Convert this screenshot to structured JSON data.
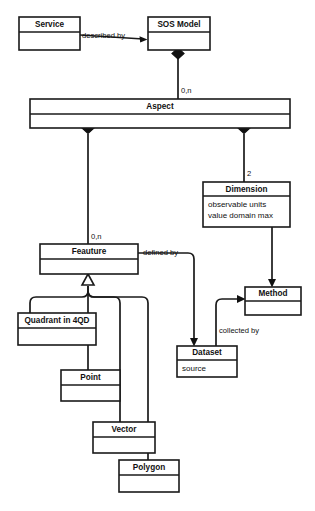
{
  "diagram": {
    "type": "uml-class-diagram",
    "background_color": "#ffffff",
    "line_color": "#1a1a1a",
    "text_color": "#111111",
    "classes": [
      {
        "id": "service",
        "name": "Service",
        "attributes": [],
        "x": 19,
        "y": 17,
        "w": 61,
        "h": 33,
        "title_h": 15
      },
      {
        "id": "sos_model",
        "name": "SOS Model",
        "attributes": [],
        "x": 148,
        "y": 17,
        "w": 62,
        "h": 33,
        "title_h": 15
      },
      {
        "id": "aspect",
        "name": "Aspect",
        "attributes": [],
        "x": 30,
        "y": 99,
        "w": 260,
        "h": 29,
        "title_h": 15
      },
      {
        "id": "dimension",
        "name": "Dimension",
        "attributes": [
          "observable units",
          "value domain max"
        ],
        "x": 203,
        "y": 182,
        "w": 87,
        "h": 45,
        "title_h": 14
      },
      {
        "id": "feauture",
        "name": "Feauture",
        "attributes": [],
        "x": 40,
        "y": 244,
        "w": 98,
        "h": 30,
        "title_h": 15
      },
      {
        "id": "method",
        "name": "Method",
        "attributes": [],
        "x": 245,
        "y": 287,
        "w": 56,
        "h": 28,
        "title_h": 14
      },
      {
        "id": "dataset",
        "name": "Dataset",
        "attributes": [
          "source"
        ],
        "x": 177,
        "y": 346,
        "w": 60,
        "h": 31,
        "title_h": 14
      },
      {
        "id": "quadrant_in_4qd",
        "name": "Quadrant in 4QD",
        "attributes": [],
        "x": 18,
        "y": 313,
        "w": 78,
        "h": 32,
        "title_h": 15
      },
      {
        "id": "point",
        "name": "Point",
        "attributes": [],
        "x": 61,
        "y": 370,
        "w": 59,
        "h": 31,
        "title_h": 15
      },
      {
        "id": "vector",
        "name": "Vector",
        "attributes": [],
        "x": 93,
        "y": 422,
        "w": 62,
        "h": 31,
        "title_h": 15
      },
      {
        "id": "polygon",
        "name": "Polygon",
        "attributes": [],
        "x": 119,
        "y": 460,
        "w": 60,
        "h": 32,
        "title_h": 15
      }
    ],
    "relationships": [
      {
        "id": "service-described-by-sos",
        "from": "service",
        "to": "sos_model",
        "label": "described by",
        "kind": "association-directed"
      },
      {
        "id": "sos-composes-aspect",
        "from": "sos_model",
        "to": "aspect",
        "label": "",
        "multiplicity": "0,n",
        "kind": "composition"
      },
      {
        "id": "aspect-composes-dimension",
        "from": "aspect",
        "to": "dimension",
        "label": "",
        "multiplicity": "2",
        "kind": "composition"
      },
      {
        "id": "aspect-composes-feauture",
        "from": "aspect",
        "to": "feauture",
        "label": "",
        "multiplicity": "0,n",
        "kind": "composition"
      },
      {
        "id": "feauture-defined-by-dataset",
        "from": "feauture",
        "to": "dataset",
        "label": "defined by",
        "kind": "association-directed"
      },
      {
        "id": "dataset-collected-by-method",
        "from": "dataset",
        "to": "method",
        "label": "collected by",
        "kind": "association-directed"
      },
      {
        "id": "dimension-to-method",
        "from": "dimension",
        "to": "method",
        "label": "",
        "kind": "association-directed"
      },
      {
        "id": "feauture-generalization",
        "from": [
          "quadrant_in_4qd",
          "point",
          "vector",
          "polygon"
        ],
        "to": "feauture",
        "label": "",
        "kind": "generalization"
      }
    ],
    "labels": {
      "described_by": "described by",
      "defined_by": "defined by",
      "collected_by": "collected by",
      "mult_sos_aspect": "0,n",
      "mult_aspect_dimension": "2",
      "mult_aspect_feauture": "0,n"
    }
  }
}
